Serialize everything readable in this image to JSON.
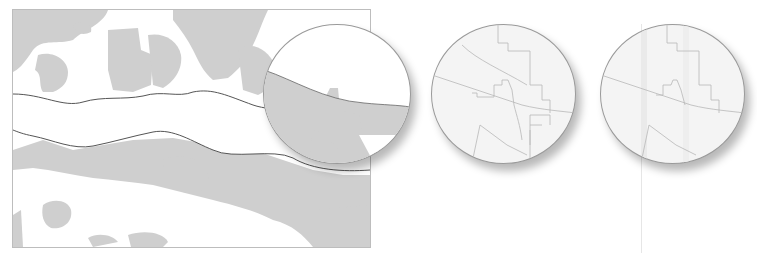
{
  "figure": {
    "type": "map-generalization-illustration",
    "panels": [
      {
        "id": "overview-map",
        "description": "Land/water polygons with a river corridor and magnifier lens"
      },
      {
        "id": "detail-lens-1",
        "description": "Magnified line-work detail"
      },
      {
        "id": "detail-lens-2",
        "description": "Magnified line-work detail with vertical guide band"
      }
    ],
    "colors": {
      "land": "#cfcfcf",
      "water": "#ffffff",
      "outline": "#555555",
      "frame": "#bdbdbd",
      "lens_fill": "#f4f4f4",
      "lens_lines": "#b8b8b8"
    }
  }
}
